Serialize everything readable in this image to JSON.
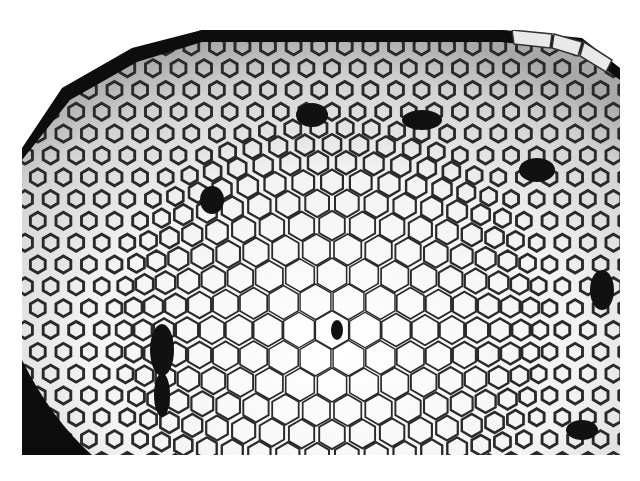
{
  "image": {
    "description": "Grayscale micrograph of a domed hexagonal cell network with dark clustered cell clumps",
    "background_color": "#ffffff",
    "cell_wall_color": "#2a2a2a",
    "cell_fill_light": "#f4f4f4",
    "cell_fill_dark": "#bdbdbd",
    "clump_color": "#111111"
  }
}
